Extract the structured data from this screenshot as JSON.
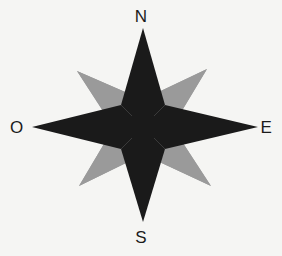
{
  "figure": {
    "name": "compass-rose",
    "background_color": "#f5f5f3",
    "width": 282,
    "height": 256
  },
  "compass": {
    "center": {
      "x": 143,
      "y": 127
    },
    "cardinal_star": {
      "color": "#1a1a1a",
      "label": "cardinal four-pointed star",
      "points": [
        {
          "name": "north-tip",
          "x": 143,
          "y": 28
        },
        {
          "name": "east-tip",
          "x": 258,
          "y": 127
        },
        {
          "name": "south-tip",
          "x": 143,
          "y": 222
        },
        {
          "name": "west-tip",
          "x": 32,
          "y": 127
        }
      ],
      "waist": 22
    },
    "intercardinal_star": {
      "color": "#9a9a9a",
      "label": "intercardinal four-pointed star",
      "points": [
        {
          "name": "northwest-tip",
          "x": 77,
          "y": 71
        },
        {
          "name": "northeast-tip",
          "x": 207,
          "y": 69
        },
        {
          "name": "southeast-tip",
          "x": 211,
          "y": 186
        },
        {
          "name": "southwest-tip",
          "x": 79,
          "y": 186
        }
      ],
      "waist": 20
    }
  },
  "labels": {
    "north": "N",
    "east": "E",
    "south": "S",
    "west": "O",
    "text_color": "#1b1b1b"
  }
}
